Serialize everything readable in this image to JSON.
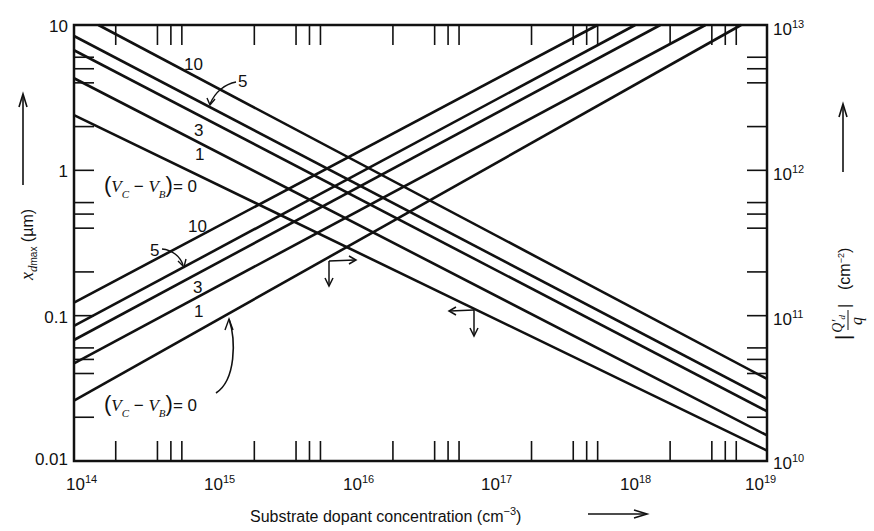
{
  "chart_data": {
    "type": "line",
    "title": "",
    "xscale": "log",
    "yscale": "log",
    "xlabel": "Substrate dopant concentration (cm⁻³)",
    "ylabel_left": "x_dmax (µm)",
    "ylabel_right": "|Q'_d / q| (cm⁻²)",
    "xlim": [
      100000000000000.0,
      1e+19
    ],
    "ylim_left": [
      0.01,
      10
    ],
    "ylim_right": [
      10000000000.0,
      10000000000000.0
    ],
    "x_tick_labels": [
      "10^14",
      "10^15",
      "10^16",
      "10^17",
      "10^18",
      "10^19"
    ],
    "y_left_tick_labels": [
      "0.01",
      "0.1",
      "1",
      "10"
    ],
    "y_right_tick_labels": [
      "10^10",
      "10^11",
      "10^12",
      "10^13"
    ],
    "grid": false,
    "legend": "inline curve labels",
    "parameter": "(V_C - V_B)",
    "parameter_values": [
      "0",
      "1",
      "3",
      "5",
      "10"
    ],
    "series_xdmax": [
      {
        "name": "10",
        "axis": "left",
        "x": [
          150000000000000.0,
          1e+19
        ],
        "y": [
          10,
          0.0367
        ]
      },
      {
        "name": "5",
        "axis": "left",
        "x": [
          100000000000000.0,
          1e+19
        ],
        "y": [
          8.4,
          0.0268
        ]
      },
      {
        "name": "3",
        "axis": "left",
        "x": [
          100000000000000.0,
          1e+19
        ],
        "y": [
          6.7,
          0.022
        ]
      },
      {
        "name": "1",
        "axis": "left",
        "x": [
          100000000000000.0,
          1e+19
        ],
        "y": [
          4.3,
          0.015
        ]
      },
      {
        "name": "0",
        "axis": "left",
        "x": [
          100000000000000.0,
          1e+19
        ],
        "y": [
          2.4,
          0.0118
        ]
      }
    ],
    "series_Qd": [
      {
        "name": "10",
        "axis": "right",
        "x": [
          100000000000000.0,
          6e+17
        ],
        "y": [
          123000000000.0,
          10000000000000.0
        ]
      },
      {
        "name": "5",
        "axis": "right",
        "x": [
          100000000000000.0,
          1.12e+18
        ],
        "y": [
          85000000000.0,
          10000000000000.0
        ]
      },
      {
        "name": "3",
        "axis": "right",
        "x": [
          100000000000000.0,
          1.7e+18
        ],
        "y": [
          68000000000.0,
          10000000000000.0
        ]
      },
      {
        "name": "1",
        "axis": "right",
        "x": [
          100000000000000.0,
          3.6e+18
        ],
        "y": [
          47000000000.0,
          10000000000000.0
        ]
      },
      {
        "name": "0",
        "axis": "right",
        "x": [
          100000000000000.0,
          6.5e+18
        ],
        "y": [
          26000000000.0,
          10000000000000.0
        ]
      }
    ],
    "annotations": [
      "10",
      "5",
      "3",
      "1",
      "(V_C - V_B) = 0",
      "10",
      "5",
      "3",
      "1",
      "(V_C - V_B) = 0"
    ]
  },
  "labels": {
    "xaxis_title": "Substrate dopant concentration (cm",
    "xaxis_exp": "−3",
    "xaxis_close": ")",
    "left_title_sym": "x",
    "left_title_sub": "d",
    "left_title_subsub": "max",
    "left_title_unit": " (µm)",
    "right_title_unit": "(cm",
    "right_title_exp": "−2",
    "right_title_close": ")",
    "right_frac_num": "Q′",
    "right_frac_num_sub": "d",
    "right_frac_den": "q",
    "curve_top_10": "10",
    "curve_top_5": "5",
    "curve_top_3": "3",
    "curve_top_1": "1",
    "curve_top_0": "= 0",
    "curve_bot_10": "10",
    "curve_bot_5": "5",
    "curve_bot_3": "3",
    "curve_bot_1": "1",
    "curve_bot_0": "= 0",
    "vc": "V",
    "vc_sub": "C",
    "minus": " − ",
    "vb": "V",
    "vb_sub": "B",
    "x_ticks": [
      {
        "base": "10",
        "exp": "14"
      },
      {
        "base": "10",
        "exp": "15"
      },
      {
        "base": "10",
        "exp": "16"
      },
      {
        "base": "10",
        "exp": "17"
      },
      {
        "base": "10",
        "exp": "18"
      },
      {
        "base": "10",
        "exp": "19"
      }
    ],
    "yl_ticks": [
      "10",
      "1",
      "0.1",
      "0.01"
    ],
    "yr_ticks": [
      {
        "base": "10",
        "exp": "13"
      },
      {
        "base": "10",
        "exp": "12"
      },
      {
        "base": "10",
        "exp": "11"
      },
      {
        "base": "10",
        "exp": "10"
      }
    ]
  },
  "colors": {
    "line": "#111111",
    "background": "#ffffff"
  }
}
